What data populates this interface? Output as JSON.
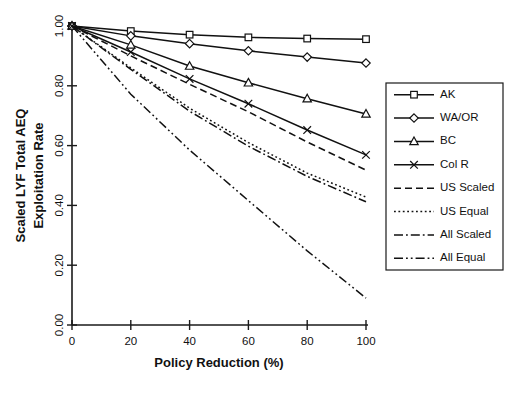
{
  "chart_data": {
    "type": "line",
    "title": "",
    "xlabel": "Policy Reduction (%)",
    "ylabel_line1": "Scaled LYF Total AEQ",
    "ylabel_line2": "Exploitation Rate",
    "x": [
      0,
      20,
      40,
      60,
      80,
      100
    ],
    "xlim": [
      0,
      100
    ],
    "ylim": [
      0.0,
      1.0
    ],
    "xticks": [
      "0",
      "20",
      "40",
      "60",
      "80",
      "100"
    ],
    "yticks": [
      "0.00",
      "0.20",
      "0.40",
      "0.60",
      "0.80",
      "1.00"
    ],
    "grid": false,
    "legend_position": "right-outside",
    "series": [
      {
        "name": "AK",
        "marker": "square",
        "dash": "solid",
        "values": [
          1.0,
          0.983,
          0.971,
          0.962,
          0.958,
          0.956
        ]
      },
      {
        "name": "WA/OR",
        "marker": "diamond",
        "dash": "solid",
        "values": [
          1.0,
          0.967,
          0.941,
          0.917,
          0.896,
          0.876
        ]
      },
      {
        "name": "BC",
        "marker": "triangle",
        "dash": "solid",
        "values": [
          1.0,
          0.937,
          0.866,
          0.81,
          0.757,
          0.706
        ]
      },
      {
        "name": "Col R",
        "marker": "x",
        "dash": "solid",
        "values": [
          1.0,
          0.913,
          0.823,
          0.74,
          0.652,
          0.569
        ]
      },
      {
        "name": "US Scaled",
        "marker": "none",
        "dash": "dashed",
        "values": [
          1.0,
          0.9,
          0.805,
          0.713,
          0.612,
          0.518
        ]
      },
      {
        "name": "US Equal",
        "marker": "none",
        "dash": "dotted",
        "values": [
          1.0,
          0.86,
          0.725,
          0.61,
          0.508,
          0.428
        ]
      },
      {
        "name": "All Scaled",
        "marker": "none",
        "dash": "dashdot",
        "values": [
          1.0,
          0.855,
          0.715,
          0.598,
          0.497,
          0.412
        ]
      },
      {
        "name": "All Equal",
        "marker": "none",
        "dash": "dashdotdot",
        "values": [
          1.0,
          0.772,
          0.585,
          0.416,
          0.248,
          0.09
        ]
      }
    ]
  },
  "axes": {
    "x_title": "Policy Reduction (%)",
    "y_title_line1": "Scaled LYF Total AEQ",
    "y_title_line2": "Exploitation Rate",
    "x_tick_labels": [
      "0",
      "20",
      "40",
      "60",
      "80",
      "100"
    ],
    "y_tick_labels": [
      "0.00",
      "0.20",
      "0.40",
      "0.60",
      "0.80",
      "1.00"
    ]
  },
  "legend": {
    "entries": [
      {
        "label": "AK"
      },
      {
        "label": "WA/OR"
      },
      {
        "label": "BC"
      },
      {
        "label": "Col R"
      },
      {
        "label": "US Scaled"
      },
      {
        "label": "US Equal"
      },
      {
        "label": "All Scaled"
      },
      {
        "label": "All Equal"
      }
    ]
  },
  "colors": {
    "ink": "#111111",
    "background": "#ffffff"
  }
}
